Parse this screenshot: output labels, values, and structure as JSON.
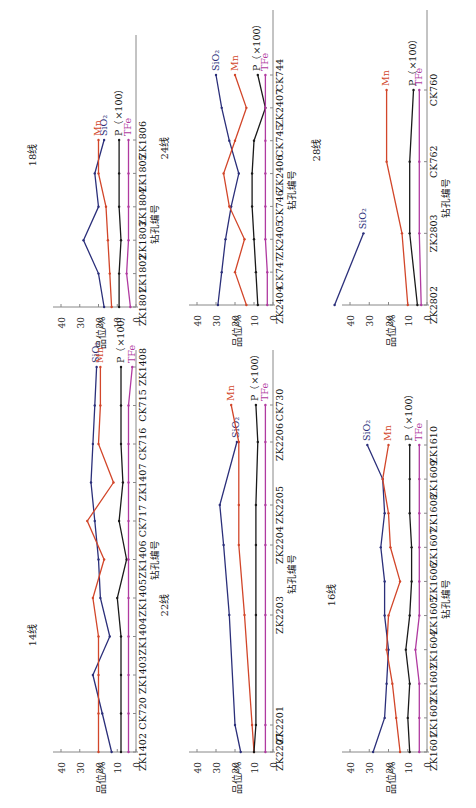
{
  "figure": {
    "orientation": "rotated-90-ccw",
    "colors": {
      "SiO2": "#2b2f7a",
      "Mn": "#d2462a",
      "P": "#1a1a1a",
      "TFe": "#b03aa0",
      "axis": "#888888"
    }
  },
  "chart_data": [
    {
      "type": "line",
      "title": "18线",
      "xlabel": "钻孔编号",
      "ylabel": "品位/%",
      "ylim": [
        0,
        40
      ],
      "yticks": [
        0,
        10,
        20,
        30,
        40
      ],
      "categories": [
        "ZK1801",
        "ZK1802",
        "ZK1803",
        "ZK1804",
        "ZK1805",
        "ZK1806"
      ],
      "series": [
        {
          "name": "SiO2",
          "label": "SiO₂",
          "values": [
            17,
            20,
            28,
            20,
            22,
            17
          ]
        },
        {
          "name": "Mn",
          "label": "Mn",
          "values": [
            13,
            14,
            15,
            16,
            20,
            20
          ]
        },
        {
          "name": "P",
          "label": "P（×100）",
          "values": [
            9,
            9,
            8,
            9,
            9,
            9
          ]
        },
        {
          "name": "TFe",
          "label": "TFe",
          "values": [
            3,
            5,
            4,
            4,
            4,
            4
          ]
        }
      ],
      "layout": {
        "x0": 136,
        "x40": 61,
        "yFirst": 307,
        "yLast": 140,
        "axisTop": 35,
        "titleX": 36,
        "titleY": 155
      }
    },
    {
      "type": "line",
      "title": "24线",
      "xlabel": "钻孔编号",
      "ylabel": "品位/%",
      "ylim": [
        0,
        40
      ],
      "yticks": [
        0,
        10,
        20,
        30,
        40
      ],
      "categories": [
        "ZK2404",
        "CK747",
        "ZK2405",
        "CK746",
        "ZK2406",
        "CK745",
        "ZK2407",
        "CK744"
      ],
      "series": [
        {
          "name": "SiO2",
          "label": "SiO₂",
          "values": [
            29,
            27,
            25,
            22,
            18,
            23,
            27,
            30
          ]
        },
        {
          "name": "Mn",
          "label": "Mn",
          "values": [
            14,
            20,
            15,
            23,
            26,
            20,
            14,
            20
          ]
        },
        {
          "name": "P",
          "label": "P（×100）",
          "values": [
            8,
            9,
            10,
            11,
            11,
            10,
            4,
            8
          ]
        },
        {
          "name": "TFe",
          "label": "TFe",
          "values": [
            3,
            3,
            4,
            4,
            4,
            4,
            4,
            4
          ]
        }
      ],
      "layout": {
        "x0": 273,
        "x40": 197,
        "yFirst": 305,
        "yLast": 75,
        "axisTop": 10,
        "titleX": 168,
        "titleY": 148
      }
    },
    {
      "type": "line",
      "title": "28线",
      "xlabel": "钻孔编号",
      "ylabel": "品位/%",
      "ylim": [
        0,
        40
      ],
      "yticks": [
        0,
        10,
        20,
        30,
        40
      ],
      "categories": [
        "ZK2802",
        "ZK2803",
        "CK762",
        "CK760"
      ],
      "series": [
        {
          "name": "SiO2",
          "label": "SiO₂",
          "values": [
            48,
            33
          ]
        },
        {
          "name": "Mn",
          "label": "Mn",
          "values": [
            10,
            13,
            21,
            21
          ]
        },
        {
          "name": "P",
          "label": "P（×100）",
          "values": [
            5,
            9,
            9,
            7
          ]
        },
        {
          "name": "TFe",
          "label": "TFe",
          "values": [
            3,
            4,
            4,
            4
          ]
        }
      ],
      "layout": {
        "x0": 427,
        "x40": 350,
        "yFirst": 305,
        "yLast": 90,
        "axisTop": 10,
        "titleX": 320,
        "titleY": 150
      }
    },
    {
      "type": "line",
      "title": "14线",
      "xlabel": "钻孔编号",
      "ylabel": "品位/%",
      "ylim": [
        0,
        40
      ],
      "yticks": [
        0,
        10,
        20,
        30,
        40
      ],
      "categories": [
        "ZK1402",
        "CK720",
        "ZK1403",
        "ZK1404",
        "ZK1405",
        "ZK1406",
        "CK717",
        "ZK1407",
        "CK716",
        "CK715",
        "ZK1408"
      ],
      "series": [
        {
          "name": "SiO2",
          "label": "SiO₂",
          "values": [
            13,
            18,
            23,
            14,
            19,
            20,
            22,
            24,
            23,
            22,
            21
          ]
        },
        {
          "name": "Mn",
          "label": "Mn",
          "values": [
            20,
            20,
            20,
            20,
            23,
            17,
            26,
            12,
            20,
            19,
            19
          ]
        },
        {
          "name": "P",
          "label": "P（×100）",
          "values": [
            8,
            8,
            8,
            8,
            10,
            5,
            9,
            7,
            8,
            8,
            8
          ]
        },
        {
          "name": "TFe",
          "label": "TFe",
          "values": [
            4,
            4,
            4,
            4,
            4,
            4,
            4,
            4,
            4,
            4,
            2
          ]
        }
      ],
      "layout": {
        "x0": 136,
        "x40": 61,
        "yFirst": 752,
        "yLast": 367,
        "axisTop": 350,
        "titleX": 36,
        "titleY": 635
      }
    },
    {
      "type": "line",
      "title": "22线",
      "xlabel": "钻孔编号",
      "ylabel": "品位/%",
      "ylim": [
        0,
        40
      ],
      "yticks": [
        0,
        10,
        20,
        30,
        40
      ],
      "categories": [
        "ZK2207",
        "ZK2201",
        "ZK2203",
        "ZK2204",
        "ZK2205",
        "ZK2206",
        "CK730"
      ],
      "series": [
        {
          "name": "SiO2",
          "label": "SiO₂",
          "values": [
            17,
            20,
            23,
            26,
            28,
            19
          ]
        },
        {
          "name": "Mn",
          "label": "Mn",
          "values": [
            10,
            11,
            15,
            18,
            18,
            18,
            22
          ]
        },
        {
          "name": "P",
          "label": "P（×100）",
          "values": [
            10,
            9,
            9,
            9,
            9,
            8,
            9
          ]
        },
        {
          "name": "TFe",
          "label": "TFe",
          "values": [
            4,
            4,
            4,
            4,
            4,
            4,
            4
          ]
        }
      ],
      "layout": {
        "x0": 273,
        "x40": 197,
        "yFirst": 752,
        "yLast": 395,
        "axisTop": 350,
        "titleX": 168,
        "titleY": 605
      },
      "category_positions": [
        752,
        725,
        615,
        545,
        505,
        442,
        405
      ]
    },
    {
      "type": "line",
      "title": "16线",
      "xlabel": "钻孔编号",
      "ylabel": "品位/%",
      "ylim": [
        0,
        40
      ],
      "yticks": [
        0,
        10,
        20,
        30,
        40
      ],
      "categories": [
        "ZK1601",
        "ZK1602",
        "ZK1603",
        "ZK1604",
        "ZK1605",
        "ZK1606",
        "ZK1607",
        "ZK1608",
        "ZK1609",
        "ZK1610"
      ],
      "series": [
        {
          "name": "SiO2",
          "label": "SiO₂",
          "values": [
            28,
            22,
            21,
            20,
            22,
            22,
            24,
            22,
            23,
            31
          ]
        },
        {
          "name": "Mn",
          "label": "Mn",
          "values": [
            14,
            16,
            18,
            21,
            20,
            14,
            19,
            20,
            23,
            20
          ]
        },
        {
          "name": "P",
          "label": "P（×100）",
          "values": [
            9,
            10,
            9,
            11,
            9,
            8,
            8,
            9,
            9,
            9
          ]
        },
        {
          "name": "TFe",
          "label": "TFe",
          "values": [
            4,
            4,
            4,
            6,
            4,
            4,
            4,
            4,
            4,
            4
          ]
        }
      ],
      "layout": {
        "x0": 427,
        "x40": 350,
        "yFirst": 752,
        "yLast": 445,
        "axisTop": 420,
        "titleX": 335,
        "titleY": 595
      }
    }
  ]
}
